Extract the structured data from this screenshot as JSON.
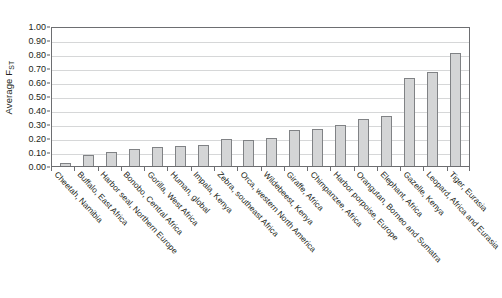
{
  "chart_data": {
    "type": "bar",
    "title": "",
    "xlabel": "",
    "ylabel": "Average F",
    "ylabel_subscript": "ST",
    "ylim": [
      0.0,
      1.0
    ],
    "y_ticks": [
      "0.00",
      "0.10",
      "0.20",
      "0.30",
      "0.40",
      "0.50",
      "0.60",
      "0.70",
      "0.80",
      "0.90",
      "1.00"
    ],
    "y_tick_values": [
      0.0,
      0.1,
      0.2,
      0.3,
      0.4,
      0.5,
      0.6,
      0.7,
      0.8,
      0.9,
      1.0
    ],
    "grid": true,
    "grid_axis": "y",
    "legend": "none",
    "bar_fill_color": "#d4d5d6",
    "bar_border_color": "#808285",
    "axis_color": "#6d6e71",
    "gridline_color": "#d6d7d8",
    "categories": [
      "Cheetah, Namibia",
      "Buffalo, East Africa",
      "Harbor seal, Northern Europe",
      "Bonobo, Central Africa",
      "Gorilla, West Africa",
      "Human, global",
      "Impala, Kenya",
      "Zebra, southeast Africa",
      "Orca, western North America",
      "Wildebeest, Kenya",
      "Giraffe, Africa",
      "Chimpanzee, Africa",
      "Harbor porpoise, Europe",
      "Orangutan, Borneo and Sumatra",
      "Elephant, Africa",
      "Gazelle, Kenya",
      "Leopard, Africa and Eurasia",
      "Tiger, Eurasia"
    ],
    "values": [
      0.02,
      0.08,
      0.1,
      0.12,
      0.135,
      0.14,
      0.15,
      0.19,
      0.185,
      0.2,
      0.26,
      0.265,
      0.29,
      0.335,
      0.355,
      0.63,
      0.67,
      0.81
    ]
  }
}
